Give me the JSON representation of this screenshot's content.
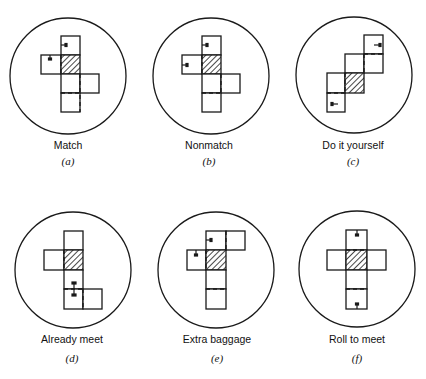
{
  "figure": {
    "panels": [
      {
        "id": "a",
        "title": "Match",
        "sublabel": "(a)"
      },
      {
        "id": "b",
        "title": "Nonmatch",
        "sublabel": "(b)"
      },
      {
        "id": "c",
        "title": "Do it yourself",
        "sublabel": "(c)"
      },
      {
        "id": "d",
        "title": "Already meet",
        "sublabel": "(d)"
      },
      {
        "id": "e",
        "title": "Extra baggage",
        "sublabel": "(e)"
      },
      {
        "id": "f",
        "title": "Roll to meet",
        "sublabel": "(f)"
      }
    ]
  },
  "colors": {
    "ink": "#1a1a1a",
    "background": "#ffffff"
  }
}
